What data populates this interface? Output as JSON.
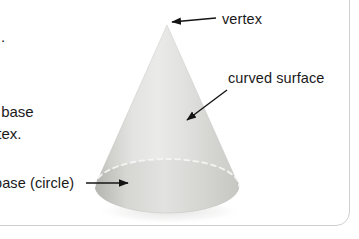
{
  "figure": {
    "shape_name": "cone",
    "background_color": "#ffffff",
    "border_color": "#cfcfcf",
    "text_color": "#1a1a1a",
    "cone_fill_light": "#e7e7e5",
    "cone_fill_mid": "#d2d2cf",
    "cone_fill_dark": "#b9b9b6",
    "hidden_edge_color": "#f2f2f0"
  },
  "annotations": [
    {
      "id": "vertex",
      "label": "vertex",
      "arrow": "arrow-left",
      "points_to": "apex of the cone"
    },
    {
      "id": "curved-surface",
      "label": "curved surface",
      "arrow": "arrow-down-left",
      "points_to": "lateral surface of the cone"
    },
    {
      "id": "base-circle",
      "label": "base (circle)",
      "arrow": "arrow-right",
      "points_to": "circular base of the cone"
    }
  ],
  "body_text": {
    "dot": ".",
    "line_1": "r base",
    "line_2": "ertex."
  },
  "geometry": {
    "apex": {
      "x": 167,
      "y": 25
    },
    "base_center": {
      "x": 167,
      "y": 186
    },
    "base_radius_x": 72,
    "base_radius_y": 27
  }
}
